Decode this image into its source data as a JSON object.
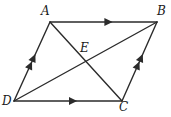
{
  "figure": {
    "kind": "geometry-diagram",
    "shape_name": "parallelogram",
    "width": 171,
    "height": 117,
    "background_color": "#ffffff",
    "stroke_color": "#2b2b2b",
    "stroke_width": 1.4
  },
  "labels": {
    "a": "A",
    "b": "B",
    "c": "C",
    "d": "D",
    "e": "E"
  },
  "label_positions": {
    "a": {
      "x": 41,
      "y": 5
    },
    "b": {
      "x": 157,
      "y": 5
    },
    "c": {
      "x": 119,
      "y": 101
    },
    "d": {
      "x": 2,
      "y": 95
    },
    "e": {
      "x": 80,
      "y": 42
    }
  },
  "points": {
    "a": {
      "x": 50,
      "y": 22
    },
    "b": {
      "x": 157,
      "y": 22
    },
    "c": {
      "x": 122,
      "y": 101
    },
    "d": {
      "x": 14,
      "y": 101
    },
    "e": {
      "x": 85,
      "y": 61
    }
  },
  "segments": [
    {
      "name": "side-ab",
      "from": "a",
      "to": "b",
      "tick_marks": 1,
      "tick_direction": "toward-b"
    },
    {
      "name": "side-dc",
      "from": "d",
      "to": "c",
      "tick_marks": 1,
      "tick_direction": "toward-c"
    },
    {
      "name": "side-da",
      "from": "d",
      "to": "a",
      "tick_marks": 2,
      "tick_direction": "toward-a"
    },
    {
      "name": "side-cb",
      "from": "c",
      "to": "b",
      "tick_marks": 2,
      "tick_direction": "toward-b"
    },
    {
      "name": "diagonal-ac",
      "from": "a",
      "to": "c",
      "tick_marks": 0,
      "tick_direction": "none"
    },
    {
      "name": "diagonal-db",
      "from": "d",
      "to": "b",
      "tick_marks": 0,
      "tick_direction": "none"
    }
  ],
  "chart_data": {
    "type": "diagram",
    "title": "",
    "vertices": [
      {
        "label": "A",
        "x": 50,
        "y": 22
      },
      {
        "label": "B",
        "x": 157,
        "y": 22
      },
      {
        "label": "C",
        "x": 122,
        "y": 101
      },
      {
        "label": "D",
        "x": 14,
        "y": 101
      },
      {
        "label": "E",
        "x": 85,
        "y": 61
      }
    ],
    "edges": [
      {
        "from": "A",
        "to": "B",
        "arrows": 1
      },
      {
        "from": "D",
        "to": "C",
        "arrows": 1
      },
      {
        "from": "D",
        "to": "A",
        "arrows": 2
      },
      {
        "from": "C",
        "to": "B",
        "arrows": 2
      },
      {
        "from": "A",
        "to": "C",
        "arrows": 0
      },
      {
        "from": "D",
        "to": "B",
        "arrows": 0
      }
    ],
    "annotations": [
      "AB is parallel to DC (single arrow marks)",
      "DA is parallel to CB (double arrow marks)",
      "E is the intersection of diagonals AC and DB"
    ]
  }
}
